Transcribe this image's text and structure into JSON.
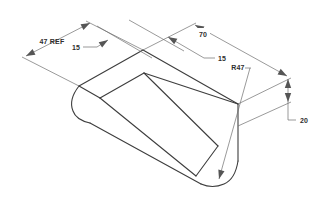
{
  "drawing": {
    "kind": "isometric-part-dimensioned-drawing",
    "background_color": "#ffffff",
    "edge_color": "#3d3d3d",
    "dim_line_color": "#6e6e6e",
    "text_color": "#2e2e2e"
  },
  "dims": {
    "ref47": "47 REF",
    "off15_left": "15",
    "off15_right": "15",
    "len70": "70",
    "r47": "R47",
    "h20": "20"
  }
}
